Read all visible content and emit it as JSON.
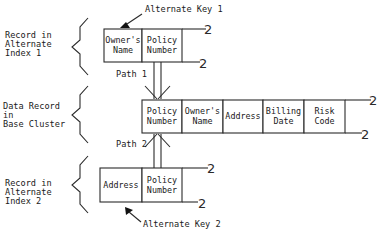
{
  "diagram": {
    "annotations": {
      "alt_key_1": "Alternate Key 1",
      "alt_key_2": "Alternate Key 2",
      "path_1": "Path 1",
      "path_2": "Path 2"
    },
    "side_labels": {
      "alt_index_1": [
        "Record in",
        "Alternate",
        "Index 1"
      ],
      "base_cluster": [
        "Data Record",
        "in",
        "Base Cluster"
      ],
      "alt_index_2": [
        "Record in",
        "Alternate",
        "Index 2"
      ]
    },
    "alt_index_1_record": {
      "fields": [
        {
          "lines": [
            "Owner's",
            "Name"
          ]
        },
        {
          "lines": [
            "Policy",
            "Number"
          ]
        }
      ]
    },
    "base_record": {
      "fields": [
        {
          "lines": [
            "Policy",
            "Number"
          ]
        },
        {
          "lines": [
            "Owner's",
            "Name"
          ]
        },
        {
          "lines": [
            "Address"
          ]
        },
        {
          "lines": [
            "Billing",
            "Date"
          ]
        },
        {
          "lines": [
            "Risk",
            "Code"
          ]
        }
      ]
    },
    "alt_index_2_record": {
      "fields": [
        {
          "lines": [
            "Address"
          ]
        },
        {
          "lines": [
            "Policy",
            "Number"
          ]
        }
      ]
    },
    "continuation_mark": "2",
    "colors": {
      "line": "#2a2a2a",
      "text": "#1a1a1a",
      "background": "#ffffff"
    }
  }
}
